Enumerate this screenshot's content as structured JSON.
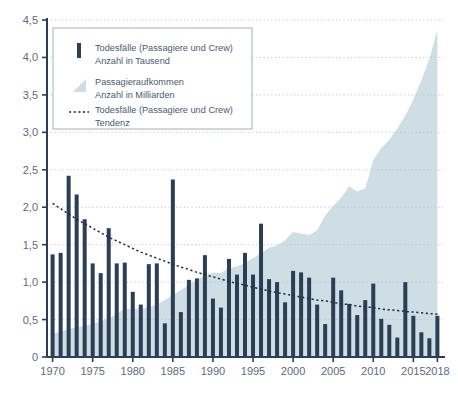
{
  "chart_data": {
    "type": "bar",
    "title": "",
    "subtitle": "",
    "xlabel": "",
    "ylabel": "",
    "xlim": [
      1969.3,
      2018.7
    ],
    "ylim": [
      0,
      4.5
    ],
    "grid": true,
    "legend_position": "top-left",
    "y_ticks": [
      "0",
      "0,5",
      "1,0",
      "1,5",
      "2,0",
      "2,5",
      "3,0",
      "3,5",
      "4,0",
      "4,5"
    ],
    "y_tick_values": [
      0,
      0.5,
      1.0,
      1.5,
      2.0,
      2.5,
      3.0,
      3.5,
      4.0,
      4.5
    ],
    "x_ticks": [
      "1970",
      "1975",
      "1980",
      "1985",
      "1990",
      "1995",
      "2000",
      "2005",
      "2010",
      "2015",
      "2018"
    ],
    "x_tick_values": [
      1970,
      1975,
      1980,
      1985,
      1990,
      1995,
      2000,
      2005,
      2010,
      2015,
      2018
    ],
    "x": [
      1970,
      1971,
      1972,
      1973,
      1974,
      1975,
      1976,
      1977,
      1978,
      1979,
      1980,
      1981,
      1982,
      1983,
      1984,
      1985,
      1986,
      1987,
      1988,
      1989,
      1990,
      1991,
      1992,
      1993,
      1994,
      1995,
      1996,
      1997,
      1998,
      1999,
      2000,
      2001,
      2002,
      2003,
      2004,
      2005,
      2006,
      2007,
      2008,
      2009,
      2010,
      2011,
      2012,
      2013,
      2014,
      2015,
      2016,
      2017,
      2018
    ],
    "series": [
      {
        "name": "Todesfälle (Passagiere und Crew)",
        "unit": "Anzahl in Tausend",
        "type": "bar",
        "color": "#2c3e55",
        "values": [
          1.37,
          1.39,
          2.42,
          2.17,
          1.84,
          1.25,
          1.12,
          1.72,
          1.25,
          1.26,
          0.87,
          0.7,
          1.24,
          1.25,
          0.45,
          2.37,
          0.6,
          1.03,
          1.05,
          1.36,
          0.78,
          0.66,
          1.31,
          1.1,
          1.39,
          1.1,
          1.78,
          1.04,
          1.0,
          0.73,
          1.15,
          1.13,
          1.06,
          0.7,
          0.44,
          1.06,
          0.89,
          0.71,
          0.56,
          0.76,
          0.98,
          0.51,
          0.43,
          0.26,
          1.0,
          0.55,
          0.33,
          0.25,
          0.55
        ]
      },
      {
        "name": "Passagieraufkommen",
        "unit": "Anzahl in Milliarden",
        "type": "area",
        "color": "#cfdde5",
        "values": [
          0.31,
          0.34,
          0.37,
          0.4,
          0.42,
          0.44,
          0.48,
          0.51,
          0.58,
          0.64,
          0.64,
          0.64,
          0.67,
          0.7,
          0.76,
          0.83,
          0.89,
          0.96,
          1.03,
          1.08,
          1.13,
          1.12,
          1.19,
          1.21,
          1.26,
          1.32,
          1.39,
          1.46,
          1.49,
          1.56,
          1.67,
          1.65,
          1.63,
          1.69,
          1.89,
          2.02,
          2.13,
          2.28,
          2.21,
          2.25,
          2.63,
          2.79,
          2.9,
          3.05,
          3.22,
          3.44,
          3.7,
          3.98,
          4.37
        ]
      },
      {
        "name": "Todesfälle (Passagiere und Crew) Tendenz",
        "unit": "",
        "type": "trend-line",
        "style": "dotted",
        "color": "#1f2d3f",
        "values": [
          2.05,
          1.98,
          1.91,
          1.84,
          1.78,
          1.72,
          1.66,
          1.6,
          1.55,
          1.5,
          1.45,
          1.4,
          1.36,
          1.32,
          1.28,
          1.24,
          1.2,
          1.17,
          1.13,
          1.1,
          1.07,
          1.04,
          1.01,
          0.98,
          0.96,
          0.93,
          0.91,
          0.88,
          0.86,
          0.84,
          0.82,
          0.8,
          0.78,
          0.76,
          0.75,
          0.73,
          0.71,
          0.7,
          0.68,
          0.67,
          0.66,
          0.64,
          0.63,
          0.62,
          0.61,
          0.6,
          0.59,
          0.58,
          0.57
        ]
      }
    ]
  },
  "legend": {
    "items": [
      {
        "marker": "bar-swatch",
        "line1": "Todesfälle (Passagiere und Crew)",
        "line2": "Anzahl in Tausend"
      },
      {
        "marker": "area-swatch",
        "line1": "Passagieraufkommen",
        "line2": "Anzahl in Milliarden"
      },
      {
        "marker": "dotted-line-swatch",
        "line1": "Todesfälle (Passagiere und Crew)",
        "line2": "Tendenz"
      }
    ]
  },
  "colors": {
    "bar": "#2c3e55",
    "area": "#cfdde5",
    "trend": "#1f2d3f",
    "axis": "#2c3e55",
    "grid": "#b9c6d2",
    "tick_text": "#5c6b7a",
    "legend_border": "#9fb0bf",
    "background": "#ffffff"
  }
}
